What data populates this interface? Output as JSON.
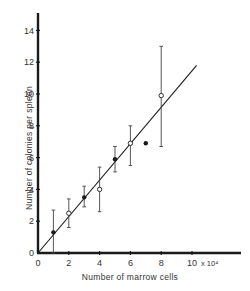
{
  "chart_data": {
    "type": "scatter",
    "title": "",
    "xlabel": "Number of marrow cells",
    "ylabel": "Number of colonies per spleen",
    "x_multiplier_label": "x 10⁴",
    "xlim": [
      0,
      11
    ],
    "ylim": [
      0,
      15
    ],
    "x_ticks": [
      0,
      2,
      4,
      6,
      8,
      10
    ],
    "y_ticks": [
      0,
      2,
      4,
      6,
      8,
      10,
      12,
      14
    ],
    "grid": false,
    "legend": null,
    "series": [
      {
        "name": "filled points",
        "marker": "filled-circle",
        "points": [
          {
            "x": 1,
            "y": 1.3,
            "err_low": 0.0,
            "err_high": 2.7
          },
          {
            "x": 3,
            "y": 3.5,
            "err_low": 2.9,
            "err_high": 4.2
          },
          {
            "x": 5,
            "y": 5.9,
            "err_low": 5.1,
            "err_high": 6.7
          },
          {
            "x": 7,
            "y": 6.9,
            "err_low": null,
            "err_high": null
          }
        ]
      },
      {
        "name": "open points",
        "marker": "open-circle",
        "points": [
          {
            "x": 2,
            "y": 2.5,
            "err_low": 1.6,
            "err_high": 3.4
          },
          {
            "x": 4,
            "y": 4.0,
            "err_low": 2.6,
            "err_high": 5.4
          },
          {
            "x": 6,
            "y": 6.9,
            "err_low": 5.5,
            "err_high": 8.0
          },
          {
            "x": 8,
            "y": 9.9,
            "err_low": 6.7,
            "err_high": 13.0
          }
        ]
      }
    ],
    "fit_line": {
      "x0": 0,
      "y0": 0,
      "x1": 10.3,
      "y1": 11.8
    }
  }
}
